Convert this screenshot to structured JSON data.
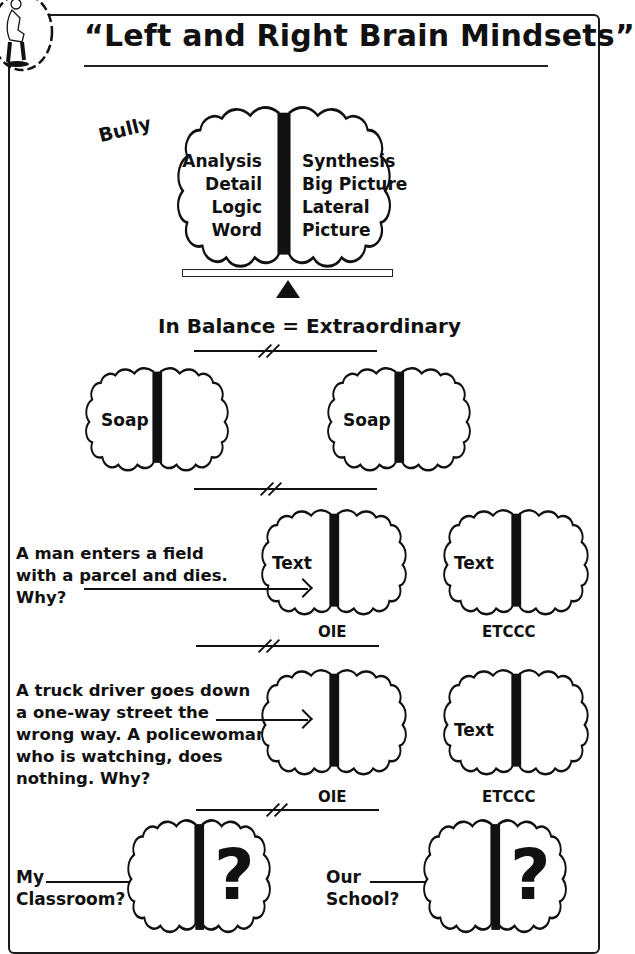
{
  "header": {
    "title": "“Left and Right Brain Mindsets”",
    "logo_icon": "thinker-statue-icon"
  },
  "top_diagram": {
    "side_label": "Bully",
    "left_hemisphere": [
      "Analysis",
      "Detail",
      "Logic",
      "Word"
    ],
    "right_hemisphere": [
      "Synthesis",
      "Big Picture",
      "Lateral",
      "Picture"
    ],
    "balance_caption": "In Balance = Extraordinary"
  },
  "soap_row": {
    "left_brain_label": "Soap",
    "right_brain_label": "Soap"
  },
  "puzzle_1": {
    "question": "A man enters a field\nwith a parcel and dies.\nWhy?",
    "brain_a_label": "Text",
    "brain_a_caption": "OIE",
    "brain_b_label": "Text",
    "brain_b_caption": "ETCCC"
  },
  "puzzle_2": {
    "question": "A truck driver goes down\na one-way street the\nwrong way. A policewoman,\nwho is watching, does\nnothing. Why?",
    "brain_a_caption": "OIE",
    "brain_b_label": "Text",
    "brain_b_caption": "ETCCC"
  },
  "bottom_row": {
    "left_label_line1": "My",
    "left_label_line2": "Classroom?",
    "left_symbol": "?",
    "right_label_line1": "Our",
    "right_label_line2": "School?",
    "right_symbol": "?"
  },
  "colors": {
    "ink": "#111111",
    "paper": "#ffffff"
  }
}
